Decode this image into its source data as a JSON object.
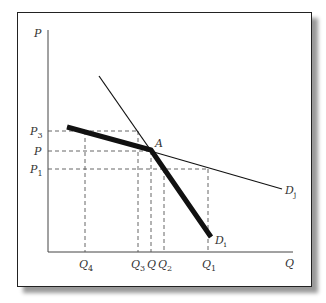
{
  "diagram": {
    "type": "kinked-demand-curve",
    "axes": {
      "y_label": "P",
      "x_label": "Q"
    },
    "price_levels": [
      {
        "label": "P",
        "sub": "3",
        "y": 131
      },
      {
        "label": "P",
        "sub": "",
        "y": 151
      },
      {
        "label": "P",
        "sub": "1",
        "y": 169
      }
    ],
    "quantity_levels": [
      {
        "label": "Q",
        "sub": "4",
        "x": 85
      },
      {
        "label": "Q",
        "sub": "3",
        "x": 138
      },
      {
        "label": "Q",
        "sub": "",
        "x": 151
      },
      {
        "label": "Q",
        "sub": "2",
        "x": 164
      },
      {
        "label": "Q",
        "sub": "1",
        "x": 208
      }
    ],
    "point": {
      "label": "A",
      "x": 151,
      "y": 150
    },
    "curves": [
      {
        "name": "D",
        "sub": "j",
        "style": "thin",
        "from": [
          67,
          127
        ],
        "to": [
          282,
          189
        ]
      },
      {
        "name": "D",
        "sub": "i",
        "style": "thin",
        "from": [
          99,
          76
        ],
        "to": [
          211,
          237
        ]
      },
      {
        "name": "kinked",
        "style": "thick",
        "points": [
          [
            67,
            127
          ],
          [
            151,
            150
          ],
          [
            211,
            237
          ]
        ]
      }
    ],
    "colors": {
      "line": "#111111",
      "dashed": "#555555",
      "frame_shadow": "#9a9a9a"
    }
  }
}
